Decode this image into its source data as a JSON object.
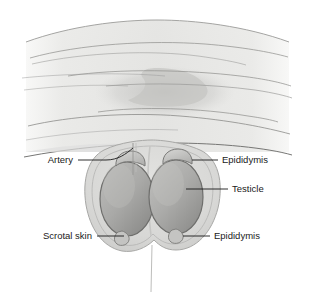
{
  "figure": {
    "background_color": "#ffffff"
  },
  "anatomy": {
    "body_fill": "#e8e8e6",
    "body_outline": "#9a9a98",
    "contour_line_color": "#8d8d8b",
    "shadow_color": "#c9c9c7",
    "scrotum_fill": "#dcdcda",
    "scrotum_outline": "#a8a8a6",
    "testicle_fill_light": "#b4b4b2",
    "testicle_fill_dark": "#8e8e8c",
    "testicle_outline": "#6e6e6c",
    "epididymis_fill": "#c6c6c4",
    "epididymis_outline": "#7a7a78",
    "artery_color": "#9a9a98",
    "raphe_color": "#bdbdbb"
  },
  "labels": [
    {
      "id": "artery",
      "text": "Artery",
      "side": "left",
      "text_x": 73,
      "text_y": 163,
      "leader": "M 78 160 L 106 160 C 118 160 126 154 133 148"
    },
    {
      "id": "epididymis-top",
      "text": "Epididymis",
      "side": "right",
      "text_x": 222,
      "text_y": 163,
      "leader": "M 181 160 L 218 160"
    },
    {
      "id": "testicle",
      "text": "Testicle",
      "side": "right",
      "text_x": 232,
      "text_y": 192,
      "leader": "M 181 189 L 228 189"
    },
    {
      "id": "epididymis-bottom",
      "text": "Epididymis",
      "side": "right",
      "text_x": 214,
      "text_y": 238,
      "leader": "M 179 235 L 210 235"
    },
    {
      "id": "scrotal-skin",
      "text": "Scrotal skin",
      "side": "left",
      "text_x": 92,
      "text_y": 238,
      "leader": "M 97 235 L 126 235"
    }
  ],
  "structures": {
    "testicle_left_label": "left testicle",
    "testicle_right_label": "right testicle",
    "epididymis_cap_left_label": "left epididymis head",
    "epididymis_cap_right_label": "right epididymis head",
    "epididymis_tail_left_label": "left epididymis tail",
    "epididymis_tail_right_label": "right epididymis tail",
    "artery_label": "spermatic artery",
    "raphe_label": "scrotal raphe"
  }
}
